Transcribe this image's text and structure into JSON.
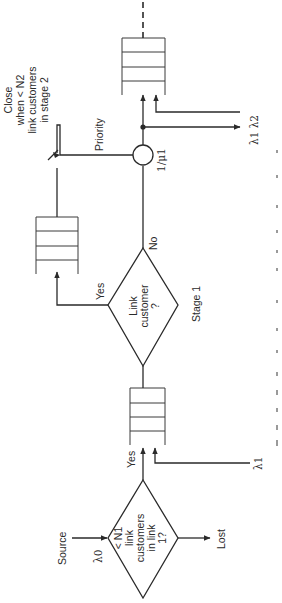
{
  "diagram": {
    "orientation": "rotated-90-ccw",
    "source": {
      "label": "Source",
      "rate": "λ0"
    },
    "decision_1": {
      "lines": [
        "< N1",
        "link",
        "customers",
        "in link",
        "1?"
      ],
      "yes_label": "Yes",
      "no_outcome": "Lost"
    },
    "queue_1": {
      "external_input": "λ1"
    },
    "decision_2": {
      "lines": [
        "Link",
        "customer",
        "?"
      ],
      "stage_label": "Stage 1",
      "yes_label": "Yes",
      "no_label": "No"
    },
    "queue_2": {
      "switch_note": [
        "Close",
        "when < N2",
        "link customers",
        "in stage 2"
      ]
    },
    "server": {
      "label": "1/μ1",
      "priority_label": "Priority"
    },
    "output": {
      "rates": "λ1 λ2"
    },
    "colors": {
      "line": "#2a2a2a",
      "background": "#ffffff",
      "caption": "#9a9a9a"
    }
  }
}
